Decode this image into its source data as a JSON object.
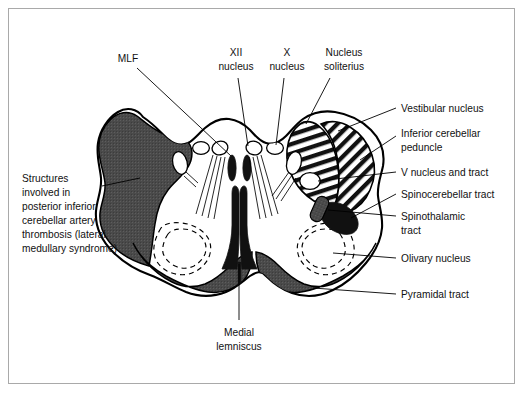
{
  "figure": {
    "frame_color": "#a9a9a9",
    "background": "#ffffff",
    "ink_color": "#000000",
    "gray_fill": "#4a4a4a",
    "black_fill": "#111111"
  },
  "labels": {
    "mlf": "MLF",
    "xii_nucleus_line1": "XII",
    "xii_nucleus_line2": "nucleus",
    "x_nucleus_line1": "X",
    "x_nucleus_line2": "nucleus",
    "nucleus_soliterius_line1": "Nucleus",
    "nucleus_soliterius_line2": "soliterius",
    "vestibular_nucleus": "Vestibular nucleus",
    "inferior_cerebellar_peduncle_line1": "Inferior cerebellar",
    "inferior_cerebellar_peduncle_line2": "peduncle",
    "v_nucleus_and_tract": "V nucleus and tract",
    "spinocerebellar_tract": "Spinocerebellar tract",
    "spinothalamic_tract_line1": "Spinothalamic",
    "spinothalamic_tract_line2": "tract",
    "olivary_nucleus": "Olivary nucleus",
    "pyramidal_tract": "Pyramidal tract",
    "medial_lemniscus_line1": "Medial",
    "medial_lemniscus_line2": "lemniscus",
    "pica_line1": "Structures",
    "pica_line2": "involved in",
    "pica_line3": "posterior inferior",
    "pica_line4": "cerebellar artery",
    "pica_line5": "thrombosis (lateral",
    "pica_line6": "medullary syndrome)"
  }
}
